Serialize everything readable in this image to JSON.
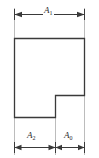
{
  "figure": {
    "kind": "engineering-dimension-drawing",
    "colors": {
      "outline": "#3a3a3a",
      "dimension_line": "#3a3a3a",
      "extension_line": "#b8b8b8",
      "label_text": "#2b2b2b",
      "background": "#ffffff"
    },
    "shape": {
      "type": "notched-rectangle",
      "outline_points": "14,38 84,38 84,95 55,95 55,117 14,117",
      "notch_corner_x": 55,
      "notch_corner_y": 95,
      "left_x": 14,
      "right_x": 84,
      "top_y": 38,
      "bottom_y": 117
    },
    "dimensions": [
      {
        "name": "overall-width",
        "label_base": "A",
        "label_sub": "1",
        "orientation": "horizontal",
        "line_y": 14,
        "from_x": 14,
        "to_x": 84,
        "span_px": 70
      },
      {
        "name": "left-segment-width",
        "label_base": "A",
        "label_sub": "2",
        "orientation": "horizontal",
        "line_y": 147,
        "from_x": 14,
        "to_x": 55,
        "span_px": 41
      },
      {
        "name": "right-segment-width",
        "label_base": "A",
        "label_sub": "0",
        "orientation": "horizontal",
        "line_y": 147,
        "from_x": 55,
        "to_x": 84,
        "span_px": 29
      }
    ],
    "extension_lines": [
      {
        "name": "extension-left",
        "x": 14,
        "from_y": 8,
        "to_y": 155
      },
      {
        "name": "extension-middle",
        "x": 55,
        "from_y": 95,
        "to_y": 155
      },
      {
        "name": "extension-right",
        "x": 84,
        "from_y": 8,
        "to_y": 155
      }
    ],
    "labels": {
      "a1": "A",
      "a1_sub": "1",
      "a2": "A",
      "a2_sub": "2",
      "a0": "A",
      "a0_sub": "0"
    }
  }
}
